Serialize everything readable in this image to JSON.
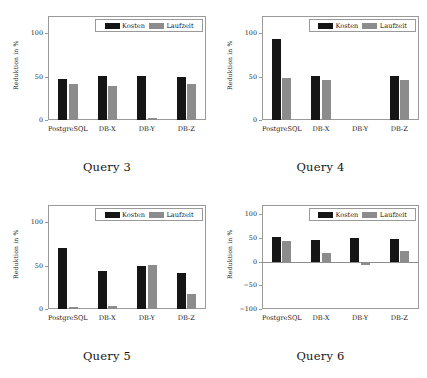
{
  "figure": {
    "axis_labels": {
      "y": "Reduktion in %"
    },
    "legend": {
      "kosten": "Kosten",
      "laufzeit": "Laufzeit"
    },
    "colors": {
      "kosten": "#151515",
      "laufzeit": "#8c8c8c",
      "frame": "#9a9a9a",
      "background": "#ffffff"
    }
  },
  "chart_data": [
    {
      "type": "bar",
      "title": "Query 3",
      "xlabel": "",
      "ylabel": "Reduktion in %",
      "ylim": [
        0,
        120
      ],
      "yticks": [
        0,
        50,
        100
      ],
      "ytick_labels": [
        "0",
        "50",
        "100"
      ],
      "grid": false,
      "legend_position": "upper center",
      "categories": [
        "PostgreSQL",
        "DB-X",
        "DB-Y",
        "DB-Z"
      ],
      "series": [
        {
          "name": "Kosten",
          "values": [
            47,
            51,
            51,
            50
          ]
        },
        {
          "name": "Laufzeit",
          "values": [
            41,
            39,
            2,
            42
          ]
        }
      ]
    },
    {
      "type": "bar",
      "title": "Query 4",
      "xlabel": "",
      "ylabel": "Reduktion in %",
      "ylim": [
        0,
        120
      ],
      "yticks": [
        0,
        50,
        100
      ],
      "ytick_labels": [
        "0",
        "50",
        "100"
      ],
      "grid": false,
      "legend_position": "upper center",
      "categories": [
        "PostgreSQL",
        "DB-X",
        "DB-Y",
        "DB-Z"
      ],
      "series": [
        {
          "name": "Kosten",
          "values": [
            93,
            51,
            0,
            51
          ]
        },
        {
          "name": "Laufzeit",
          "values": [
            48,
            46,
            0,
            46
          ]
        }
      ]
    },
    {
      "type": "bar",
      "title": "Query 5",
      "xlabel": "",
      "ylabel": "Reduktion in %",
      "ylim": [
        0,
        120
      ],
      "yticks": [
        0,
        50,
        100
      ],
      "ytick_labels": [
        "0",
        "50",
        "100"
      ],
      "grid": false,
      "legend_position": "upper center",
      "categories": [
        "PostgreSQL",
        "DB-X",
        "DB-Y",
        "DB-Z"
      ],
      "series": [
        {
          "name": "Kosten",
          "values": [
            70,
            44,
            50,
            41
          ]
        },
        {
          "name": "Laufzeit",
          "values": [
            2,
            3,
            51,
            17
          ]
        }
      ]
    },
    {
      "type": "bar",
      "title": "Query 6",
      "xlabel": "",
      "ylabel": "Reduktion in %",
      "ylim": [
        -100,
        120
      ],
      "yticks": [
        -100,
        -50,
        0,
        50,
        100
      ],
      "ytick_labels": [
        "-100",
        "-50",
        "0",
        "50",
        "100"
      ],
      "grid": false,
      "legend_position": "upper center",
      "categories": [
        "PostgreSQL",
        "DB-X",
        "DB-Y",
        "DB-Z"
      ],
      "series": [
        {
          "name": "Kosten",
          "values": [
            52,
            47,
            50,
            49
          ]
        },
        {
          "name": "Laufzeit",
          "values": [
            43,
            18,
            -6,
            23
          ]
        }
      ]
    }
  ]
}
